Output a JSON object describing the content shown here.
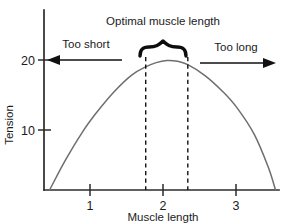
{
  "chart_data": {
    "type": "line",
    "title": "",
    "xlabel": "Muscle length",
    "ylabel": "Tension",
    "xlim": [
      0.25,
      3.6
    ],
    "ylim": [
      0,
      26
    ],
    "grid": false,
    "legend": "none",
    "x_ticks": [
      "1",
      "2",
      "3"
    ],
    "x_tick_values": [
      1,
      2,
      3
    ],
    "y_ticks": [
      "10",
      "20"
    ],
    "y_tick_values": [
      10,
      20
    ],
    "series": [
      {
        "name": "Length-tension curve",
        "color": "#6e6e6e",
        "x": [
          0.33,
          0.55,
          0.8,
          1.0,
          1.25,
          1.5,
          1.7,
          1.85,
          2.0,
          2.15,
          2.3,
          2.55,
          2.8,
          3.0,
          3.25,
          3.45,
          3.55
        ],
        "y": [
          0.0,
          4.2,
          8.4,
          11.2,
          14.2,
          16.6,
          17.8,
          18.4,
          18.7,
          18.6,
          18.1,
          16.5,
          14.2,
          11.9,
          8.0,
          3.2,
          0.0
        ]
      }
    ],
    "annotations": [
      {
        "name": "optimal-range",
        "label": "Optimal muscle length",
        "type": "brace",
        "x_start": 1.7,
        "x_end": 2.3
      },
      {
        "name": "too-short-region",
        "label": "Too short",
        "type": "arrow-left",
        "x_from": 1.45,
        "x_to": 0.32,
        "y": 20
      },
      {
        "name": "too-long-region",
        "label": "Too long",
        "type": "arrow-right",
        "x_from": 2.55,
        "x_to": 3.52,
        "y": 20
      }
    ],
    "dashed_guides": [
      1.7,
      2.3
    ]
  },
  "labels": {
    "x_axis_title": "Muscle length",
    "y_axis_title": "Tension",
    "optimal": "Optimal muscle length",
    "too_short": "Too short",
    "too_long": "Too long",
    "x_tick_1": "1",
    "x_tick_2": "2",
    "x_tick_3": "3",
    "y_tick_10": "10",
    "y_tick_20": "20"
  },
  "colors": {
    "curve": "#6e6e6e",
    "axis": "#2b2b2b",
    "text": "#1b1b1b",
    "background": "#ffffff"
  }
}
